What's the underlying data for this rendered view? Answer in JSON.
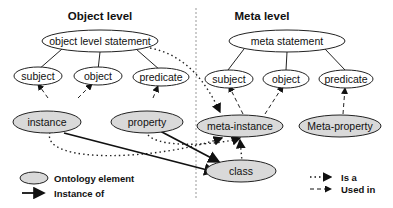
{
  "titles": {
    "object_level": "Object level",
    "meta_level": "Meta level"
  },
  "object_level": {
    "statement": "object level statement",
    "subject": "subject",
    "object": "object",
    "predicate": "predicate",
    "instance": "instance",
    "property": "property"
  },
  "meta_level": {
    "statement": "meta statement",
    "subject": "subject",
    "object": "object",
    "predicate": "predicate",
    "meta_instance": "meta-instance",
    "meta_property": "Meta-property"
  },
  "center": {
    "class": "class"
  },
  "legend": {
    "ontology_element": "Ontology element",
    "instance_of": "Instance of",
    "is_a": "Is a",
    "used_in": "Used in"
  },
  "colors": {
    "element_fill": "#d9d9d9",
    "stroke": "#222222",
    "divider": "#999999"
  }
}
